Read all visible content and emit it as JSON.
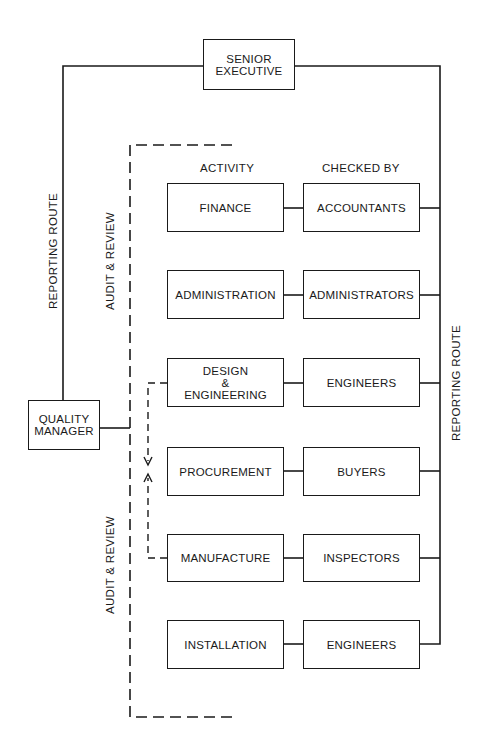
{
  "diagram": {
    "type": "organisation chart",
    "top_box": {
      "label": "SENIOR\nEXECUTIVE"
    },
    "quality_manager": {
      "label": "QUALITY\nMANAGER"
    },
    "column_headers": {
      "activity": "ACTIVITY",
      "checked_by": "CHECKED BY"
    },
    "side_labels": {
      "left_reporting_route": "REPORTING ROUTE",
      "upper_audit_review": "AUDIT & REVIEW",
      "lower_audit_review": "AUDIT & REVIEW",
      "right_reporting_route": "REPORTING ROUTE"
    },
    "rows": [
      {
        "activity": "FINANCE",
        "checked_by": "ACCOUNTANTS"
      },
      {
        "activity": "ADMINISTRATION",
        "checked_by": "ADMINISTRATORS"
      },
      {
        "activity": "DESIGN\n&\nENGINEERING",
        "checked_by": "ENGINEERS"
      },
      {
        "activity": "PROCUREMENT",
        "checked_by": "BUYERS"
      },
      {
        "activity": "MANUFACTURE",
        "checked_by": "INSPECTORS"
      },
      {
        "activity": "INSTALLATION",
        "checked_by": "ENGINEERS"
      }
    ],
    "feedback_loop": {
      "from": "MANUFACTURE",
      "to": "DESIGN & ENGINEERING",
      "style": "dashed double-arrow"
    },
    "colors": {
      "line": "#1a1a1a",
      "background": "#ffffff"
    }
  }
}
